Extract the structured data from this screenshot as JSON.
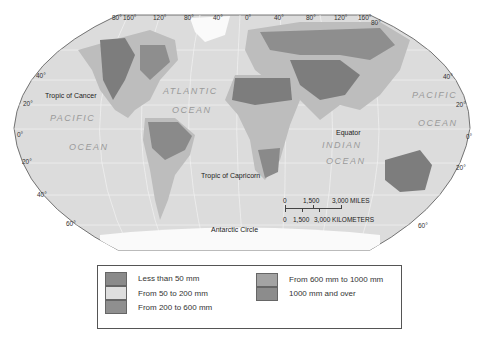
{
  "map": {
    "parallels": {
      "left": [
        "40°",
        "20°",
        "0°",
        "20°",
        "40°",
        "60°"
      ],
      "right": [
        "40°",
        "20°",
        "0°",
        "20°",
        "60°"
      ]
    },
    "meridians_top": [
      "80°",
      "160°",
      "120°",
      "80°",
      "40°",
      "0°",
      "40°",
      "80°",
      "120°",
      "160°",
      "80°"
    ],
    "oceans": {
      "atlantic_1": "ATLANTIC",
      "atlantic_2": "OCEAN",
      "pacific_w_1": "PACIFIC",
      "pacific_w_2": "OCEAN",
      "pacific_e_1": "PACIFIC",
      "pacific_e_2": "OCEAN",
      "indian_1": "INDIAN",
      "indian_2": "OCEAN"
    },
    "lines": {
      "tropic_cancer": "Tropic of Cancer",
      "equator": "Equator",
      "tropic_capricorn": "Tropic of Capricorn",
      "antarctic_circle": "Antarctic Circle"
    },
    "scale": {
      "miles": [
        "0",
        "1,500",
        "3,000 MILES"
      ],
      "km": [
        "0",
        "1,500",
        "3,000 KILOMETERS"
      ]
    },
    "colors": {
      "ocean": "#dcdcdc",
      "land": "#bdbdbd",
      "dry": "#7d7d7d",
      "wet": "#8e8e8e",
      "grid": "#f4f4f4"
    }
  },
  "legend": {
    "items": [
      {
        "label": "Less than 50 mm",
        "color": "#8a8a8a"
      },
      {
        "label": "From 50 to 200 mm",
        "color": "#dedede"
      },
      {
        "label": "From 200 to 600 mm",
        "color": "#8f8f8f"
      },
      {
        "label": "From 600 mm to 1000 mm",
        "color": "#a3a3a3"
      },
      {
        "label": "1000 mm and over",
        "color": "#8c8c8c"
      }
    ]
  }
}
